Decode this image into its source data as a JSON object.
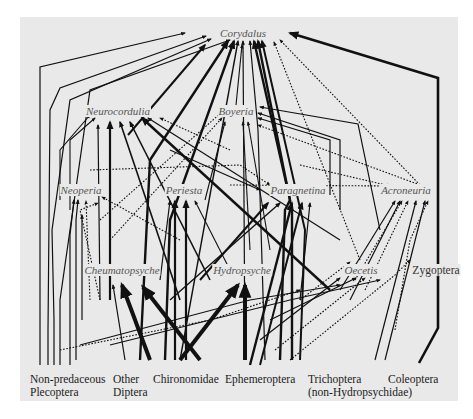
{
  "diagram": {
    "type": "food-web",
    "background_color": "#e9e9e9",
    "line_color": "#111111",
    "predators": [
      {
        "id": "corydalus",
        "label": "Corydalus",
        "x": 243,
        "y": 33
      },
      {
        "id": "neurocordulia",
        "label": "Neurocordulia",
        "x": 118,
        "y": 111
      },
      {
        "id": "boyeria",
        "label": "Boyeria",
        "x": 236,
        "y": 111
      },
      {
        "id": "neoperia",
        "label": "Neoperia",
        "x": 81,
        "y": 190
      },
      {
        "id": "periesta",
        "label": "Periesta",
        "x": 184,
        "y": 190
      },
      {
        "id": "paragnetina",
        "label": "Paragnetina",
        "x": 298,
        "y": 190
      },
      {
        "id": "acroneuria",
        "label": "Acroneuria",
        "x": 406,
        "y": 190
      },
      {
        "id": "cheumatopsyche",
        "label": "Cheumatopsyche",
        "x": 122,
        "y": 270
      },
      {
        "id": "hydropsyche",
        "label": "Hydropsyche",
        "x": 242,
        "y": 270
      },
      {
        "id": "oecetis",
        "label": "Oecetis",
        "x": 361,
        "y": 270
      },
      {
        "id": "zygoptera",
        "label": "Zygoptera",
        "x": 436,
        "y": 270,
        "italic": false
      }
    ],
    "prey": [
      {
        "id": "non-predaceous-plecoptera",
        "line1": "Non-predaceous",
        "line2": "Plecoptera",
        "x": 30
      },
      {
        "id": "other-diptera",
        "line1": "Other",
        "line2": "Diptera",
        "x": 113
      },
      {
        "id": "chironomidae",
        "line1": "Chironomidae",
        "line2": "",
        "x": 153
      },
      {
        "id": "ephemeroptera",
        "line1": "Ephemeroptera",
        "line2": "",
        "x": 225
      },
      {
        "id": "trichoptera",
        "line1": "Trichoptera",
        "line2": "(non-Hydropsychidae)",
        "x": 308
      },
      {
        "id": "coleoptera",
        "line1": "Coleoptera",
        "line2": "",
        "x": 388
      }
    ],
    "links": [
      {
        "d": "M40,365 L40,67 L185,33",
        "w": 1.2,
        "style": "solid"
      },
      {
        "d": "M48,365 L48,330 L50,110 L60,88 L206,36",
        "w": 1.2,
        "style": "solid"
      },
      {
        "d": "M54,365 L54,320 L52,230 L70,100 L211,39",
        "w": 1.2,
        "style": "solid"
      },
      {
        "d": "M60,365 L60,300 L75,195 L90,90 L230,40",
        "w": 1.2,
        "style": "solid"
      },
      {
        "d": "M140,360 L150,160 L228,41",
        "w": 2.4,
        "style": "solid"
      },
      {
        "d": "M165,360 L170,220 L234,41",
        "w": 2.4,
        "style": "solid"
      },
      {
        "d": "M180,360 L238,41",
        "w": 1.4,
        "style": "solid"
      },
      {
        "d": "M245,360 L243,41",
        "w": 1.2,
        "style": "solid"
      },
      {
        "d": "M265,360 L258,130 L250,41",
        "w": 1.2,
        "style": "solid"
      },
      {
        "d": "M280,360 L285,210 L290,200 L254,41",
        "w": 2.4,
        "style": "solid"
      },
      {
        "d": "M292,360 L292,210 L258,41",
        "w": 2.4,
        "style": "solid"
      },
      {
        "d": "M300,360 L305,230 L262,41",
        "w": 2.0,
        "style": "solid"
      },
      {
        "d": "M419,363 L438,328 L438,78 L290,33",
        "w": 2.6,
        "style": "solid"
      },
      {
        "d": "M360,260 L274,42",
        "w": 1.1,
        "style": "dotted"
      },
      {
        "d": "M420,185 L280,40",
        "w": 1.1,
        "style": "dotted"
      },
      {
        "d": "M128,135 L205,45",
        "w": 2.0,
        "style": "solid"
      },
      {
        "d": "M236,105 L242,45",
        "w": 1.1,
        "style": "solid"
      },
      {
        "d": "M60,200 L60,150 L90,115",
        "w": 1.1,
        "style": "solid"
      },
      {
        "d": "M70,210 L70,140 L95,118",
        "w": 1.1,
        "style": "solid"
      },
      {
        "d": "M100,300 L98,125",
        "w": 1.2,
        "style": "solid"
      },
      {
        "d": "M110,300 L110,122",
        "w": 2.2,
        "style": "solid"
      },
      {
        "d": "M180,300 L120,122",
        "w": 1.6,
        "style": "solid"
      },
      {
        "d": "M210,280 L130,122",
        "w": 1.6,
        "style": "solid"
      },
      {
        "d": "M330,290 L142,118",
        "w": 2.4,
        "style": "solid"
      },
      {
        "d": "M340,240 L148,118",
        "w": 1.2,
        "style": "solid"
      },
      {
        "d": "M230,150 L160,118",
        "w": 1.1,
        "style": "dotted"
      },
      {
        "d": "M100,220 L222,112",
        "w": 1.1,
        "style": "dotted"
      },
      {
        "d": "M110,240 L222,118",
        "w": 1.1,
        "style": "dotted"
      },
      {
        "d": "M205,200 L225,122",
        "w": 1.1,
        "style": "solid"
      },
      {
        "d": "M250,250 L243,122",
        "w": 1.1,
        "style": "solid"
      },
      {
        "d": "M270,250 L248,122",
        "w": 1.1,
        "style": "solid"
      },
      {
        "d": "M330,195 L330,140 L258,118",
        "w": 1.2,
        "style": "solid"
      },
      {
        "d": "M340,210 L340,140 L258,113",
        "w": 1.2,
        "style": "solid"
      },
      {
        "d": "M380,230 L358,124 L260,107",
        "w": 1.2,
        "style": "solid"
      },
      {
        "d": "M420,185 L258,125",
        "w": 1.1,
        "style": "dotted"
      },
      {
        "d": "M70,365 L70,235 L74,200",
        "w": 1.2,
        "style": "solid"
      },
      {
        "d": "M76,360 L76,220 L78,200",
        "w": 1.2,
        "style": "solid"
      },
      {
        "d": "M90,300 L86,201",
        "w": 1.1,
        "style": "dotted"
      },
      {
        "d": "M100,300 L80,210 L98,203",
        "w": 1.1,
        "style": "dotted"
      },
      {
        "d": "M82,320 L82,215",
        "w": 1.2,
        "style": "solid"
      },
      {
        "d": "M180,240 L102,197",
        "w": 1.1,
        "style": "dotted"
      },
      {
        "d": "M175,360 L175,201",
        "w": 2.2,
        "style": "solid"
      },
      {
        "d": "M186,360 L186,201",
        "w": 2.2,
        "style": "solid"
      },
      {
        "d": "M230,270 L195,201",
        "w": 1.1,
        "style": "solid"
      },
      {
        "d": "M160,280 L170,201",
        "w": 1.2,
        "style": "solid"
      },
      {
        "d": "M170,150 L260,190",
        "w": 1.1,
        "style": "solid"
      },
      {
        "d": "M250,365 L292,203",
        "w": 2.4,
        "style": "solid"
      },
      {
        "d": "M260,365 L302,203",
        "w": 2.0,
        "style": "solid"
      },
      {
        "d": "M300,300 L310,203",
        "w": 1.2,
        "style": "solid"
      },
      {
        "d": "M200,280 L268,203",
        "w": 2.0,
        "style": "solid"
      },
      {
        "d": "M170,300 L280,203",
        "w": 1.4,
        "style": "solid"
      },
      {
        "d": "M90,170 L240,165 L270,185",
        "w": 1.1,
        "style": "dotted"
      },
      {
        "d": "M340,290 L395,201",
        "w": 1.2,
        "style": "solid"
      },
      {
        "d": "M350,300 L400,201",
        "w": 1.2,
        "style": "solid"
      },
      {
        "d": "M355,280 L402,201",
        "w": 1.1,
        "style": "dotted"
      },
      {
        "d": "M365,290 L408,201",
        "w": 1.1,
        "style": "dotted"
      },
      {
        "d": "M375,360 L416,201",
        "w": 1.2,
        "style": "solid"
      },
      {
        "d": "M385,360 L425,201",
        "w": 1.2,
        "style": "solid"
      },
      {
        "d": "M395,330 L410,240 L428,201",
        "w": 1.1,
        "style": "dotted"
      },
      {
        "d": "M230,185 L390,186",
        "w": 1.1,
        "style": "dotted"
      },
      {
        "d": "M300,165 L390,186",
        "w": 1.1,
        "style": "dotted"
      },
      {
        "d": "M125,360 L113,285",
        "w": 1.2,
        "style": "solid"
      },
      {
        "d": "M150,360 L122,285",
        "w": 4.0,
        "style": "solid"
      },
      {
        "d": "M200,360 L143,287",
        "w": 4.0,
        "style": "solid"
      },
      {
        "d": "M180,360 L238,285",
        "w": 4.0,
        "style": "solid"
      },
      {
        "d": "M245,360 L245,285",
        "w": 4.0,
        "style": "solid"
      },
      {
        "d": "M260,340 L340,278",
        "w": 1.2,
        "style": "solid"
      },
      {
        "d": "M270,320 L356,278",
        "w": 1.2,
        "style": "solid"
      },
      {
        "d": "M275,350 L365,278",
        "w": 1.1,
        "style": "dotted"
      },
      {
        "d": "M290,360 L395,275 L410,260",
        "w": 1.1,
        "style": "dotted"
      },
      {
        "d": "M300,300 L350,262",
        "w": 1.1,
        "style": "dotted"
      },
      {
        "d": "M60,350 L210,320 L300,290",
        "w": 1.1,
        "style": "dotted"
      },
      {
        "d": "M80,345 L250,300 L340,285",
        "w": 1.1,
        "style": "solid"
      },
      {
        "d": "M110,345 L290,300 L380,280",
        "w": 1.1,
        "style": "solid"
      }
    ]
  }
}
